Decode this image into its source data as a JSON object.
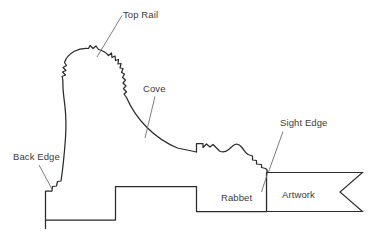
{
  "diagram": {
    "kind": "frame-molding-cross-section",
    "background_color": "#ffffff",
    "outline_color": "#2b2b2b",
    "label_color": "#3b3b3b",
    "leader_color": "#6e6e6e",
    "labels": {
      "top_rail": "Top Rail",
      "cove": "Cove",
      "sight_edge": "Sight Edge",
      "back_edge": "Back Edge",
      "rabbet": "Rabbet",
      "artwork": "Artwork"
    }
  }
}
